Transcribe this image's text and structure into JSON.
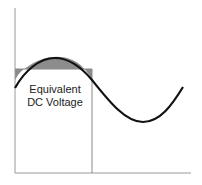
{
  "diagram": {
    "label_line1": "Equivalent",
    "label_line2": "DC Voltage",
    "colors": {
      "axis": "#9a9a9a",
      "wave": "#111111",
      "fill": "#8c8c8c",
      "rect_border": "#8a8a8a"
    }
  }
}
